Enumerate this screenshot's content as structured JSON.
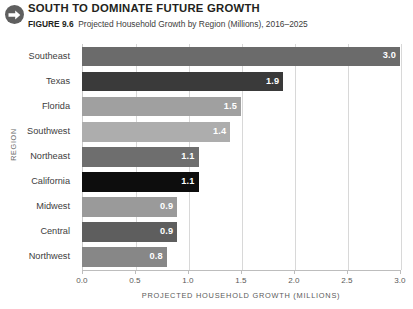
{
  "header": {
    "icon": "arrow-right-circle-icon",
    "title": "SOUTH TO DOMINATE FUTURE GROWTH",
    "figure_number": "FIGURE 9.6",
    "figure_caption": "Projected Household Growth by Region (Millions), 2016–2025"
  },
  "chart_data": {
    "type": "bar",
    "orientation": "horizontal",
    "title": "SOUTH TO DOMINATE FUTURE GROWTH",
    "subtitle": "Projected Household Growth by Region (Millions), 2016–2025",
    "xlabel": "PROJECTED HOUSEHOLD GROWTH (MILLIONS)",
    "ylabel": "REGION",
    "categories": [
      "Southeast",
      "Texas",
      "Florida",
      "Southwest",
      "Northeast",
      "California",
      "Midwest",
      "Central",
      "Northwest"
    ],
    "values": [
      3.0,
      1.9,
      1.5,
      1.4,
      1.1,
      1.1,
      0.9,
      0.9,
      0.8
    ],
    "value_labels": [
      "3.0",
      "1.9",
      "1.5",
      "1.4",
      "1.1",
      "1.1",
      "0.9",
      "0.9",
      "0.8"
    ],
    "bar_colors": [
      "#6b6b6b",
      "#3a3a3a",
      "#a0a0a0",
      "#adadad",
      "#6e6e6e",
      "#0d0d0d",
      "#9a9a9a",
      "#5e5e5e",
      "#878787"
    ],
    "xlim": [
      0.0,
      3.0
    ],
    "xticks": [
      0.0,
      0.5,
      1.0,
      1.5,
      2.0,
      2.5,
      3.0
    ],
    "xtick_labels": [
      "0.0",
      "0.5",
      "1.0",
      "1.5",
      "2.0",
      "2.5",
      "3.0"
    ],
    "grid": true,
    "grid_axis": "x",
    "legend": "none"
  }
}
